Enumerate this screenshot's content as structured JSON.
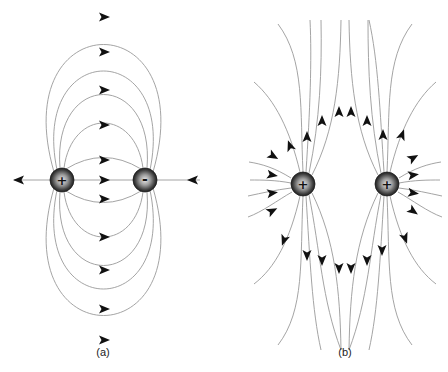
{
  "figure": {
    "panels": [
      {
        "id": "a",
        "caption": "(a)",
        "description": "Electric field lines of an electric dipole (positive and negative charge)",
        "charges": [
          {
            "sign": "+",
            "label": "+",
            "type": "positive",
            "x": 62,
            "y": 180
          },
          {
            "sign": "-",
            "label": "-",
            "type": "negative",
            "x": 145,
            "y": 180
          }
        ],
        "field_lines_above": 5,
        "field_lines_below": 5,
        "axis_arrows": 3
      },
      {
        "id": "b",
        "caption": "(b)",
        "description": "Electric field lines of two equal positive charges",
        "charges": [
          {
            "sign": "+",
            "label": "+",
            "type": "positive",
            "x": 303,
            "y": 184
          },
          {
            "sign": "+",
            "label": "+",
            "type": "positive",
            "x": 387,
            "y": 184
          }
        ]
      }
    ],
    "colors": {
      "field_line": "#9a9a9a",
      "arrow": "#111111",
      "charge_dark": "#2a2a2a",
      "charge_light": "#d8d8d8",
      "background": "#ffffff"
    }
  }
}
